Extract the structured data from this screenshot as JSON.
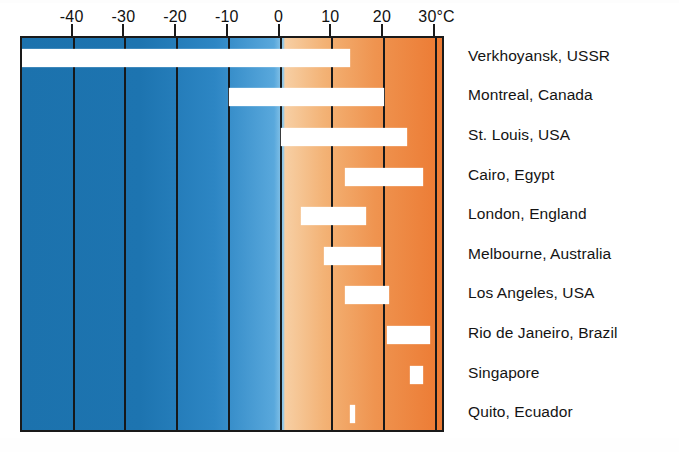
{
  "chart_data": {
    "type": "bar",
    "orientation": "horizontal",
    "subtype": "range-bar",
    "title": "",
    "xlabel": "",
    "ylabel": "",
    "axis_unit": "°C",
    "xlim": [
      -50,
      32
    ],
    "grid": true,
    "legend": false,
    "tick_labels": [
      "-40",
      "-30",
      "-20",
      "-10",
      "0",
      "10",
      "20",
      "30°C"
    ],
    "tick_values": [
      -40,
      -30,
      -20,
      -10,
      0,
      10,
      20,
      30
    ],
    "categories": [
      "Verkhoyansk, USSR",
      "Montreal, Canada",
      "St. Louis, USA",
      "Cairo, Egypt",
      "London, England",
      "Melbourne, Australia",
      "Los Angeles, USA",
      "Rio de Janeiro, Brazil",
      "Singapore",
      "Quito, Ecuador"
    ],
    "ranges": [
      {
        "city": "Verkhoyansk, USSR",
        "min": -50,
        "max": 13.5
      },
      {
        "city": "Montreal, Canada",
        "min": -10,
        "max": 20
      },
      {
        "city": "St. Louis, USA",
        "min": 0,
        "max": 24.5
      },
      {
        "city": "Cairo, Egypt",
        "min": 12.5,
        "max": 27.5
      },
      {
        "city": "London, England",
        "min": 4,
        "max": 16.5
      },
      {
        "city": "Melbourne, Australia",
        "min": 8.5,
        "max": 19.5
      },
      {
        "city": "Los Angeles, USA",
        "min": 12.5,
        "max": 21
      },
      {
        "city": "Rio de Janeiro, Brazil",
        "min": 20.5,
        "max": 29
      },
      {
        "city": "Singapore",
        "min": 25,
        "max": 27.5
      },
      {
        "city": "Quito, Ecuador",
        "min": 13.5,
        "max": 14.5
      }
    ],
    "colors": {
      "bar": "#ffffff",
      "cold_end": "#1c72ad",
      "cool_mid": "#59a8dc",
      "warm_start": "#f7cfa4",
      "hot_end": "#ec7a33",
      "gridline": "#16181a",
      "frame": "#1a1a1a",
      "text": "#141414"
    }
  }
}
